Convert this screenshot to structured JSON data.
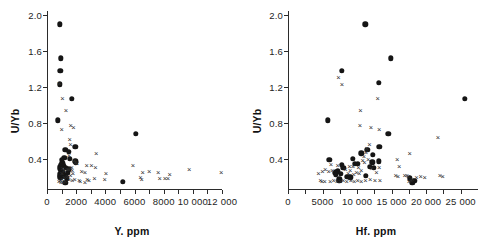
{
  "figure": {
    "background": "#ffffff",
    "marker_color": "#151515",
    "cross_color": "#2e2e2e"
  },
  "chart_data": [
    {
      "type": "scatter",
      "title": "",
      "xlabel": "Y. ppm",
      "ylabel": "U/Yb",
      "xlim": [
        0,
        12000
      ],
      "ylim": [
        0.05,
        2.05
      ],
      "grid": false,
      "legend": "none",
      "xticks": [
        0,
        1000,
        2000,
        3000,
        4000,
        5000,
        6000,
        7000,
        8000,
        9000,
        10000,
        11000,
        12000
      ],
      "xticklabels": [
        "0",
        "",
        "2000",
        "",
        "4000",
        "",
        "6000",
        "",
        "8000",
        "",
        "10 000",
        "",
        "12 000"
      ],
      "yticks": [
        0.4,
        0.8,
        1.2,
        1.6,
        2.0
      ],
      "yticklabels": [
        "0.4",
        "0.8",
        "1.2",
        "1.6",
        "2.0"
      ],
      "series": [
        {
          "name": "filled-circle",
          "marker": "circle",
          "points": [
            [
              880,
              1.9
            ],
            [
              930,
              1.52
            ],
            [
              900,
              1.38
            ],
            [
              880,
              1.23
            ],
            [
              1700,
              1.07
            ],
            [
              760,
              0.83
            ],
            [
              6080,
              0.68
            ],
            [
              1950,
              0.53
            ],
            [
              1250,
              0.5
            ],
            [
              1480,
              0.48
            ],
            [
              1180,
              0.41
            ],
            [
              1560,
              0.4
            ],
            [
              1010,
              0.39
            ],
            [
              1930,
              0.37
            ],
            [
              1980,
              0.36
            ],
            [
              1040,
              0.35
            ],
            [
              1100,
              0.34
            ],
            [
              980,
              0.33
            ],
            [
              1150,
              0.32
            ],
            [
              920,
              0.31
            ],
            [
              1300,
              0.3
            ],
            [
              870,
              0.29
            ],
            [
              1480,
              0.28
            ],
            [
              950,
              0.26
            ],
            [
              1050,
              0.25
            ],
            [
              1420,
              0.24
            ],
            [
              880,
              0.23
            ],
            [
              1180,
              0.22
            ],
            [
              860,
              0.21
            ],
            [
              1260,
              0.2
            ],
            [
              900,
              0.19
            ],
            [
              1340,
              0.18
            ],
            [
              1250,
              0.13
            ],
            [
              5200,
              0.14
            ]
          ]
        },
        {
          "name": "cross",
          "marker": "cross",
          "points": [
            [
              860,
              1.25
            ],
            [
              1060,
              1.08
            ],
            [
              1300,
              0.94
            ],
            [
              1000,
              0.73
            ],
            [
              1620,
              0.78
            ],
            [
              1820,
              0.75
            ],
            [
              1560,
              0.62
            ],
            [
              1600,
              0.56
            ],
            [
              3380,
              0.46
            ],
            [
              1500,
              0.44
            ],
            [
              5900,
              0.33
            ],
            [
              9750,
              0.29
            ],
            [
              11950,
              0.25
            ],
            [
              2720,
              0.33
            ],
            [
              3050,
              0.33
            ],
            [
              3320,
              0.31
            ],
            [
              1880,
              0.38
            ],
            [
              1940,
              0.36
            ],
            [
              2050,
              0.35
            ],
            [
              1700,
              0.31
            ],
            [
              1600,
              0.3
            ],
            [
              1480,
              0.29
            ],
            [
              1380,
              0.28
            ],
            [
              1720,
              0.27
            ],
            [
              2380,
              0.26
            ],
            [
              2600,
              0.25
            ],
            [
              4050,
              0.24
            ],
            [
              6560,
              0.25
            ],
            [
              7000,
              0.26
            ],
            [
              7620,
              0.25
            ],
            [
              8420,
              0.23
            ],
            [
              7720,
              0.18
            ],
            [
              8080,
              0.18
            ],
            [
              8300,
              0.18
            ],
            [
              6500,
              0.17
            ],
            [
              6400,
              0.19
            ],
            [
              3950,
              0.17
            ],
            [
              3250,
              0.18
            ],
            [
              2880,
              0.16
            ],
            [
              2600,
              0.14
            ],
            [
              2280,
              0.15
            ],
            [
              1900,
              0.17
            ],
            [
              1720,
              0.16
            ],
            [
              1500,
              0.17
            ],
            [
              1250,
              0.15
            ],
            [
              1100,
              0.14
            ],
            [
              960,
              0.14
            ],
            [
              820,
              0.15
            ],
            [
              900,
              0.16
            ],
            [
              1050,
              0.17
            ],
            [
              1180,
              0.19
            ],
            [
              1400,
              0.21
            ],
            [
              1600,
              0.22
            ],
            [
              1780,
              0.24
            ],
            [
              1180,
              0.27
            ],
            [
              1020,
              0.24
            ],
            [
              1080,
              0.3
            ],
            [
              2750,
              0.17
            ],
            [
              2200,
              0.16
            ]
          ]
        }
      ]
    },
    {
      "type": "scatter",
      "title": "",
      "xlabel": "Hf. ppm",
      "ylabel": "U/Yb",
      "xlim": [
        0,
        27500
      ],
      "ylim": [
        0.05,
        2.05
      ],
      "grid": false,
      "legend": "none",
      "xticks": [
        0,
        2500,
        5000,
        7500,
        10000,
        12500,
        15000,
        17500,
        20000,
        22500,
        25000
      ],
      "xticklabels": [
        "0",
        "",
        "5000",
        "",
        "10 000",
        "",
        "15 000",
        "",
        "20 000",
        "",
        "25 000"
      ],
      "yticks": [
        0.4,
        0.8,
        1.2,
        1.6,
        2.0
      ],
      "yticklabels": [
        "0.4",
        "0.8",
        "1.2",
        "1.6",
        "2.0"
      ],
      "series": [
        {
          "name": "filled-circle",
          "marker": "circle",
          "points": [
            [
              11200,
              1.9
            ],
            [
              14900,
              1.52
            ],
            [
              7800,
              1.38
            ],
            [
              13100,
              1.25
            ],
            [
              25600,
              1.07
            ],
            [
              5800,
              0.83
            ],
            [
              14500,
              0.68
            ],
            [
              13200,
              0.53
            ],
            [
              11500,
              0.5
            ],
            [
              10600,
              0.46
            ],
            [
              12300,
              0.44
            ],
            [
              9400,
              0.4
            ],
            [
              6000,
              0.39
            ],
            [
              13100,
              0.37
            ],
            [
              12200,
              0.36
            ],
            [
              10100,
              0.34
            ],
            [
              9700,
              0.34
            ],
            [
              7800,
              0.33
            ],
            [
              11800,
              0.31
            ],
            [
              12400,
              0.3
            ],
            [
              8000,
              0.3
            ],
            [
              7200,
              0.26
            ],
            [
              6900,
              0.25
            ],
            [
              6800,
              0.24
            ],
            [
              7600,
              0.23
            ],
            [
              6950,
              0.22
            ],
            [
              8600,
              0.2
            ],
            [
              7400,
              0.17
            ],
            [
              7450,
              0.15
            ],
            [
              18300,
              0.15
            ],
            [
              18000,
              0.13
            ],
            [
              17600,
              0.18
            ],
            [
              9000,
              0.19
            ],
            [
              11300,
              0.21
            ]
          ]
        },
        {
          "name": "cross",
          "marker": "cross",
          "points": [
            [
              7300,
              1.31
            ],
            [
              7800,
              1.23
            ],
            [
              13000,
              1.08
            ],
            [
              10500,
              0.94
            ],
            [
              10400,
              0.78
            ],
            [
              12000,
              0.75
            ],
            [
              13200,
              0.73
            ],
            [
              11800,
              0.56
            ],
            [
              11400,
              0.52
            ],
            [
              11300,
              0.47
            ],
            [
              17600,
              0.46
            ],
            [
              21700,
              0.64
            ],
            [
              15800,
              0.4
            ],
            [
              11000,
              0.43
            ],
            [
              11600,
              0.4
            ],
            [
              10800,
              0.38
            ],
            [
              11050,
              0.36
            ],
            [
              6200,
              0.34
            ],
            [
              7200,
              0.33
            ],
            [
              8900,
              0.32
            ],
            [
              9400,
              0.32
            ],
            [
              10200,
              0.31
            ],
            [
              5400,
              0.28
            ],
            [
              5900,
              0.26
            ],
            [
              6400,
              0.27
            ],
            [
              8300,
              0.28
            ],
            [
              9000,
              0.27
            ],
            [
              10600,
              0.27
            ],
            [
              12100,
              0.3
            ],
            [
              13200,
              0.31
            ],
            [
              16100,
              0.32
            ],
            [
              16900,
              0.22
            ],
            [
              15600,
              0.22
            ],
            [
              15900,
              0.21
            ],
            [
              17200,
              0.22
            ],
            [
              17400,
              0.21
            ],
            [
              18600,
              0.2
            ],
            [
              19200,
              0.21
            ],
            [
              19800,
              0.19
            ],
            [
              22000,
              0.22
            ],
            [
              22400,
              0.21
            ],
            [
              17800,
              0.16
            ],
            [
              17500,
              0.15
            ],
            [
              18000,
              0.17
            ],
            [
              13300,
              0.16
            ],
            [
              12600,
              0.16
            ],
            [
              11900,
              0.17
            ],
            [
              11200,
              0.16
            ],
            [
              10600,
              0.15
            ],
            [
              10100,
              0.16
            ],
            [
              9600,
              0.15
            ],
            [
              9100,
              0.16
            ],
            [
              8500,
              0.15
            ],
            [
              8000,
              0.16
            ],
            [
              7600,
              0.15
            ],
            [
              7100,
              0.15
            ],
            [
              6600,
              0.16
            ],
            [
              6100,
              0.15
            ],
            [
              5300,
              0.15
            ],
            [
              4700,
              0.16
            ],
            [
              4400,
              0.24
            ],
            [
              5000,
              0.26
            ],
            [
              4900,
              0.15
            ],
            [
              9900,
              0.25
            ],
            [
              10300,
              0.24
            ],
            [
              9500,
              0.23
            ],
            [
              8700,
              0.24
            ],
            [
              12800,
              0.25
            ]
          ]
        }
      ]
    }
  ]
}
